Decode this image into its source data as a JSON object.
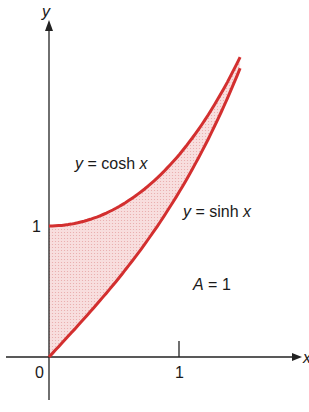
{
  "diagram": {
    "type": "area-between-curves",
    "axes": {
      "x_label": "x",
      "y_label": "y",
      "origin_label": "0",
      "x_tick_label": "1",
      "y_tick_label": "1"
    },
    "curves": [
      {
        "name": "cosh",
        "label_var": "y",
        "label_eq": " = cosh ",
        "label_arg": "x",
        "color": "#d32f2f"
      },
      {
        "name": "sinh",
        "label_var": "y",
        "label_eq": " = sinh ",
        "label_arg": "x",
        "color": "#d32f2f"
      }
    ],
    "area": {
      "label_var": "A",
      "label_eq": " = 1",
      "fill": "#f6d3d3"
    },
    "x_range": [
      0,
      1.47
    ]
  }
}
